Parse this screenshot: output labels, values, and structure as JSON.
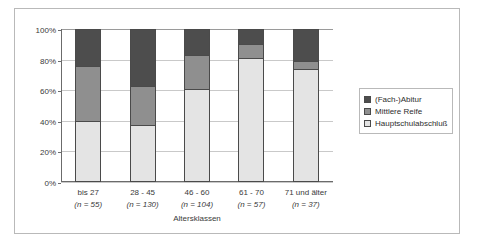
{
  "chart_data": {
    "type": "bar",
    "subtype": "stacked-100-percent",
    "title": "",
    "xlabel": "Altersklassen",
    "ylabel": "",
    "ylim": [
      0,
      100
    ],
    "yticks": [
      "0%",
      "20%",
      "40%",
      "60%",
      "80%",
      "100%"
    ],
    "grid": true,
    "legend_position": "right",
    "categories": [
      "bis 27",
      "28 - 45",
      "46 - 60",
      "61 - 70",
      "71 und älter"
    ],
    "category_notes": [
      "(n = 55)",
      "(n = 130)",
      "(n = 104)",
      "(n = 57)",
      "(n = 37)"
    ],
    "series": [
      {
        "name": "Hauptschulabschluß",
        "color": "#e4e4e4",
        "values": [
          40,
          37,
          61,
          81,
          74
        ]
      },
      {
        "name": "Mittlere Reife",
        "color": "#8f8f8f",
        "values": [
          36,
          26,
          22,
          9,
          5
        ]
      },
      {
        "name": "(Fach-)Abitur",
        "color": "#4d4d4d",
        "values": [
          24,
          37,
          17,
          10,
          21
        ]
      }
    ],
    "legend_entries": [
      "(Fach-)Abitur",
      "Mittlere Reife",
      "Hauptschulabschluß"
    ]
  },
  "axis": {
    "y_ticks": [
      {
        "label": "100%",
        "value": 100
      },
      {
        "label": "80%",
        "value": 80
      },
      {
        "label": "60%",
        "value": 60
      },
      {
        "label": "40%",
        "value": 40
      },
      {
        "label": "20%",
        "value": 20
      },
      {
        "label": "0%",
        "value": 0
      }
    ],
    "x_title": "Altersklassen"
  },
  "colors": {
    "abitur": "#4d4d4d",
    "mittlere_reife": "#8f8f8f",
    "hauptschulabschluss": "#e4e4e4",
    "frame": "#b9b9b9",
    "axis": "#6b6b6b",
    "grid": "#c9c9c9"
  }
}
